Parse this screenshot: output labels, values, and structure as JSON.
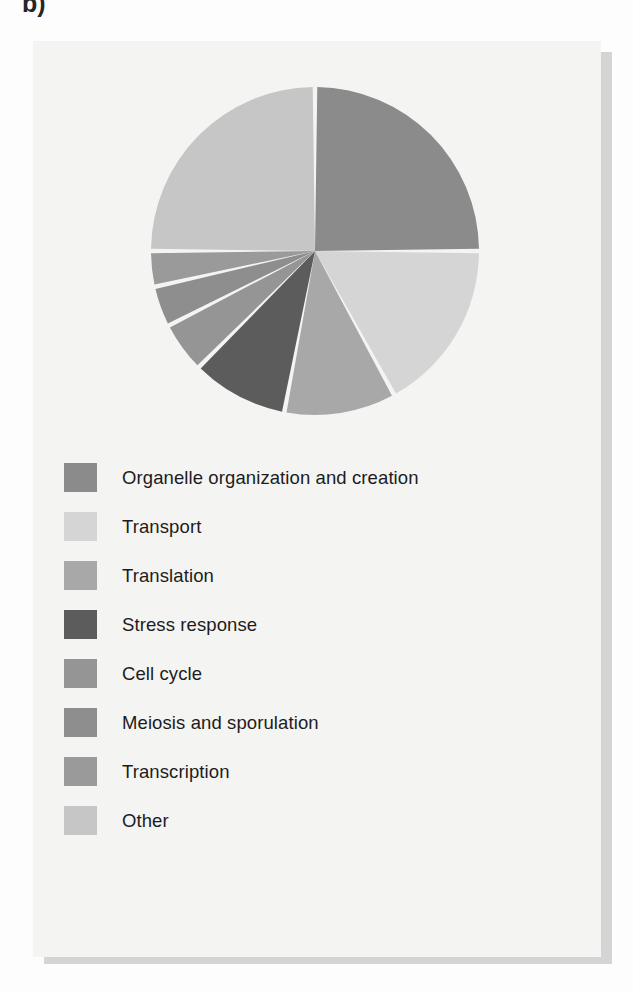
{
  "panel": {
    "label": "b)"
  },
  "legend": {
    "items": [
      {
        "label": "Organelle organization and creation",
        "color": "#8b8b8b"
      },
      {
        "label": "Transport",
        "color": "#d5d5d5"
      },
      {
        "label": "Translation",
        "color": "#a8a8a8"
      },
      {
        "label": "Stress response",
        "color": "#5c5c5c"
      },
      {
        "label": "Cell cycle",
        "color": "#959595"
      },
      {
        "label": "Meiosis and sporulation",
        "color": "#8e8e8e"
      },
      {
        "label": "Transcription",
        "color": "#9a9a9a"
      },
      {
        "label": "Other",
        "color": "#c6c6c6"
      }
    ]
  },
  "chart_data": {
    "type": "pie",
    "title": "",
    "legend_position": "bottom",
    "start_angle_deg": 0,
    "direction": "clockwise",
    "gap_deg": 1.6,
    "labels": [
      "Organelle organization and creation",
      "Transport",
      "Translation",
      "Stress response",
      "Cell cycle",
      "Meiosis and sporulation",
      "Transcription",
      "Other"
    ],
    "colors": [
      "#8b8b8b",
      "#d5d5d5",
      "#a8a8a8",
      "#5c5c5c",
      "#959595",
      "#8e8e8e",
      "#9a9a9a",
      "#c6c6c6"
    ],
    "values": [
      25.0,
      17.0,
      11.0,
      9.5,
      5.0,
      4.0,
      3.5,
      25.0
    ],
    "units": "percent",
    "angles_deg": [
      90.0,
      61.2,
      39.6,
      34.2,
      18.0,
      14.4,
      12.6,
      90.0
    ]
  }
}
